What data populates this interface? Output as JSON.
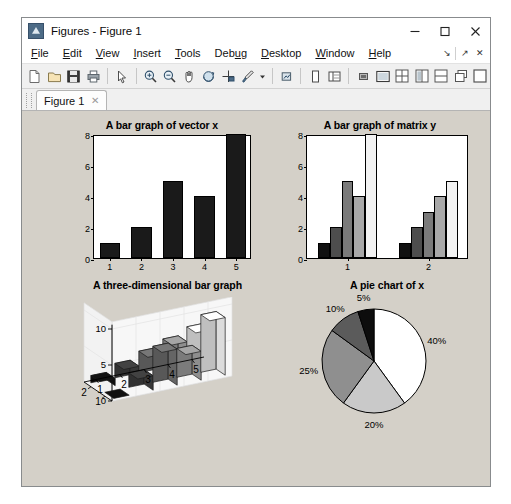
{
  "window": {
    "title": "Figures - Figure 1",
    "app_icon": "matlab-figure-icon",
    "minimize": "minimize-icon",
    "maximize": "maximize-icon",
    "close": "close-icon"
  },
  "menu": {
    "items": [
      {
        "label": "File",
        "mnemonic": "F"
      },
      {
        "label": "Edit",
        "mnemonic": "E"
      },
      {
        "label": "View",
        "mnemonic": "V"
      },
      {
        "label": "Insert",
        "mnemonic": "I"
      },
      {
        "label": "Tools",
        "mnemonic": "T"
      },
      {
        "label": "Debug",
        "mnemonic": "u"
      },
      {
        "label": "Desktop",
        "mnemonic": "D"
      },
      {
        "label": "Window",
        "mnemonic": "W"
      },
      {
        "label": "Help",
        "mnemonic": "H"
      }
    ],
    "right_controls": [
      "dock-arrow-icon",
      "undock-arrow-icon",
      "close-panel-icon"
    ]
  },
  "toolbar": {
    "buttons": [
      {
        "name": "new-figure-icon",
        "tooltip": "New Figure"
      },
      {
        "name": "open-file-icon",
        "tooltip": "Open File"
      },
      {
        "name": "save-figure-icon",
        "tooltip": "Save Figure"
      },
      {
        "name": "print-figure-icon",
        "tooltip": "Print Figure"
      },
      {
        "name": "edit-plot-arrow-icon",
        "tooltip": "Edit Plot"
      },
      {
        "name": "zoom-in-icon",
        "tooltip": "Zoom In"
      },
      {
        "name": "zoom-out-icon",
        "tooltip": "Zoom Out"
      },
      {
        "name": "pan-hand-icon",
        "tooltip": "Pan"
      },
      {
        "name": "rotate-3d-icon",
        "tooltip": "Rotate 3D"
      },
      {
        "name": "data-cursor-icon",
        "tooltip": "Data Cursor"
      },
      {
        "name": "brush-data-icon",
        "tooltip": "Brush/Select Data"
      },
      {
        "name": "brush-dropdown-icon",
        "tooltip": "Brush Options"
      },
      {
        "name": "link-plot-icon",
        "tooltip": "Link Plot"
      },
      {
        "name": "figure-palette-icon",
        "tooltip": "Figure Palette"
      },
      {
        "name": "plot-browser-icon",
        "tooltip": "Plot Browser"
      },
      {
        "name": "property-editor-icon",
        "tooltip": "Property Editor"
      },
      {
        "name": "show-plot-tools-icon",
        "tooltip": "Show Plot Tools"
      }
    ],
    "layout_buttons": [
      {
        "name": "tile-grid-icon",
        "tooltip": "Tile All"
      },
      {
        "name": "tile-vertical-icon",
        "tooltip": "Tile Left/Right"
      },
      {
        "name": "tile-horizontal-icon",
        "tooltip": "Tile Top/Bottom"
      },
      {
        "name": "cascade-icon",
        "tooltip": "Cascade"
      },
      {
        "name": "single-pane-icon",
        "tooltip": "Single Pane"
      }
    ]
  },
  "tabs": [
    {
      "label": "Figure 1",
      "close": "close-tab-icon",
      "active": true
    }
  ],
  "chart_data": [
    {
      "type": "bar",
      "id": "bar-vector-x",
      "title": "A bar graph of vector x",
      "categories": [
        "1",
        "2",
        "3",
        "4",
        "5"
      ],
      "values": [
        1,
        2,
        5,
        4,
        8
      ],
      "xlabel": "",
      "ylabel": "",
      "ylim": [
        0,
        8
      ],
      "yticks": [
        0,
        2,
        4,
        6,
        8
      ],
      "grid": false,
      "bar_color": "#1a1a1a",
      "edge_color": "#000000"
    },
    {
      "type": "bar",
      "id": "bar-matrix-y",
      "title": "A bar graph of matrix y",
      "categories": [
        "1",
        "2"
      ],
      "series": [
        {
          "name": "col1",
          "values": [
            1,
            1
          ],
          "color": "#111111"
        },
        {
          "name": "col2",
          "values": [
            2,
            2
          ],
          "color": "#4d4d4d"
        },
        {
          "name": "col3",
          "values": [
            5,
            3
          ],
          "color": "#7a7a7a"
        },
        {
          "name": "col4",
          "values": [
            4,
            4
          ],
          "color": "#a8a8a8"
        },
        {
          "name": "col5",
          "values": [
            8,
            5
          ],
          "color": "#f2f2f2"
        }
      ],
      "xlabel": "",
      "ylabel": "",
      "ylim": [
        0,
        8
      ],
      "yticks": [
        0,
        2,
        4,
        6,
        8
      ],
      "grid": false
    },
    {
      "type": "bar",
      "id": "bar3-three-dimensional",
      "title": "A three-dimensional bar graph",
      "projection": "3d",
      "x_categories": [
        "1",
        "2",
        "3",
        "4",
        "5"
      ],
      "y_categories": [
        "1",
        "2"
      ],
      "zlim": [
        0,
        10
      ],
      "zticks": [
        0,
        5,
        10
      ],
      "xticks": [
        "1",
        "2",
        "3",
        "4",
        "5"
      ],
      "yticks": [
        "1",
        "2"
      ],
      "series": [
        {
          "name": "row1",
          "values": [
            0,
            2,
            5,
            4,
            8
          ],
          "shades": [
            "#111111",
            "#3d3d3d",
            "#6e6e6e",
            "#9a9a9a",
            "#efefef"
          ]
        },
        {
          "name": "row2",
          "values": [
            1,
            2,
            3,
            4,
            5
          ],
          "shades": [
            "#111111",
            "#3d3d3d",
            "#6e6e6e",
            "#9a9a9a",
            "#efefef"
          ]
        }
      ],
      "grid": true
    },
    {
      "type": "pie",
      "id": "pie-of-x",
      "title": "A pie chart of x",
      "labels": [
        "40%",
        "20%",
        "25%",
        "10%",
        "5%"
      ],
      "values": [
        40,
        20,
        25,
        10,
        5
      ],
      "colors": [
        "#ffffff",
        "#c9c9c9",
        "#8f8f8f",
        "#5b5b5b",
        "#0d0d0d"
      ],
      "edge_color": "#000000",
      "start_angle_deg": 90,
      "direction": "clockwise"
    }
  ],
  "colors": {
    "figure_background": "#d4d0c8",
    "axes_background": "#ffffff",
    "window_chrome": "#f0f0f0",
    "accent": "#4d6b86"
  }
}
